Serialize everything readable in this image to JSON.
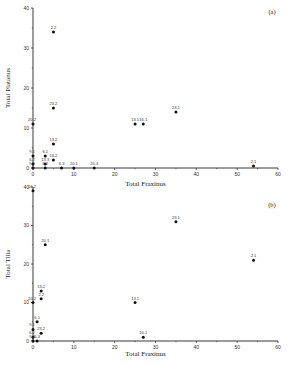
{
  "chart_data": [
    {
      "type": "scatter",
      "panel_label": "(a)",
      "xlabel": "Total Fraxinus",
      "ylabel": "Total Platanus",
      "xlim": [
        0,
        60
      ],
      "ylim": [
        0,
        40
      ],
      "xticks": [
        "0",
        "10",
        "20",
        "30",
        "40",
        "50",
        "60"
      ],
      "yticks": [
        "0",
        "10",
        "20",
        "30",
        "40"
      ],
      "points": [
        {
          "label": "2.2",
          "x": 5,
          "y": 34
        },
        {
          "label": "23.2",
          "x": 5,
          "y": 15
        },
        {
          "label": "20.2",
          "x": 0,
          "y": 11
        },
        {
          "label": "13.2",
          "x": 5,
          "y": 6
        },
        {
          "label": "6.1",
          "x": 3,
          "y": 3
        },
        {
          "label": "9.1",
          "x": 0,
          "y": 3
        },
        {
          "label": "16.2",
          "x": 5,
          "y": 2
        },
        {
          "label": "6.2",
          "x": 0,
          "y": 1
        },
        {
          "label": "13.3",
          "x": 3,
          "y": 1
        },
        {
          "label": "20.3",
          "x": 15,
          "y": 0
        },
        {
          "label": "9.2",
          "x": 0,
          "y": 0
        },
        {
          "label": "6.2b",
          "x": 3,
          "y": 0
        },
        {
          "label": "6.3",
          "x": 7,
          "y": 0
        },
        {
          "label": "20.1",
          "x": 10,
          "y": 0
        },
        {
          "label": "13.1",
          "x": 25,
          "y": 11
        },
        {
          "label": "16.1",
          "x": 27,
          "y": 11
        },
        {
          "label": "23.1",
          "x": 35,
          "y": 14
        },
        {
          "label": "2.1",
          "x": 54,
          "y": 0.5
        }
      ]
    },
    {
      "type": "scatter",
      "panel_label": "(b)",
      "xlabel": "Total Fraxinus",
      "ylabel": "Total Tilia",
      "xlim": [
        0,
        60
      ],
      "ylim": [
        0,
        40
      ],
      "xticks": [
        "0",
        "10",
        "20",
        "30",
        "40",
        "50",
        "60"
      ],
      "yticks": [
        "0",
        "10",
        "20",
        "30",
        "40"
      ],
      "points": [
        {
          "label": "16.2",
          "x": 0,
          "y": 39
        },
        {
          "label": "20.1",
          "x": 3,
          "y": 25
        },
        {
          "label": "23.1",
          "x": 35,
          "y": 31
        },
        {
          "label": "2.1",
          "x": 54,
          "y": 21
        },
        {
          "label": "13.2",
          "x": 2,
          "y": 13
        },
        {
          "label": "2.2",
          "x": 2,
          "y": 11
        },
        {
          "label": "20.2",
          "x": 0,
          "y": 10
        },
        {
          "label": "13.1",
          "x": 25,
          "y": 10
        },
        {
          "label": "6.1",
          "x": 1,
          "y": 5
        },
        {
          "label": "9.1",
          "x": 0,
          "y": 3
        },
        {
          "label": "23.2",
          "x": 2,
          "y": 2
        },
        {
          "label": "6.2",
          "x": 0,
          "y": 1
        },
        {
          "label": "16.1",
          "x": 27,
          "y": 1
        },
        {
          "label": "6.3",
          "x": 1,
          "y": 0
        },
        {
          "label": "9.2",
          "x": 0,
          "y": 0
        }
      ]
    }
  ]
}
